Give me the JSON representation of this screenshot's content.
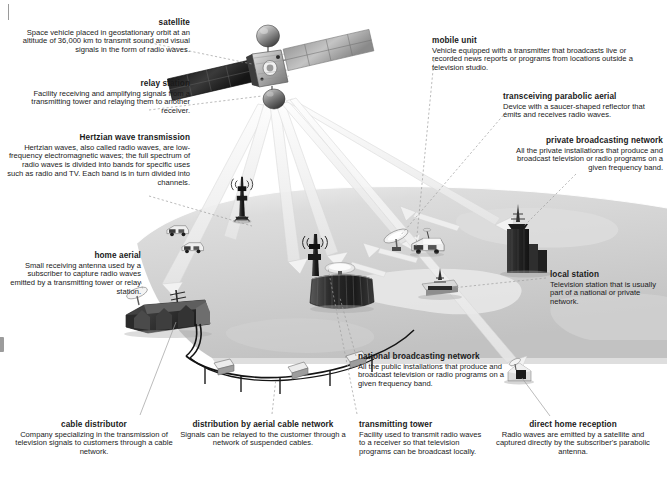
{
  "figure": {
    "background_color": "#ffffff",
    "text_color": "#1a1a1a",
    "leader_line_color": "#9a9a9a",
    "ground_color": "#c9c9c9",
    "ground_light_color": "#e2e2e2",
    "beam_color": "#efefef"
  },
  "callouts": [
    {
      "id": "satellite",
      "title": "satellite",
      "body": "Space vehicle placed in geostationary orbit at an altitude of 36,000 km to transmit sound and visual signals in the form of radio waves.",
      "align": "right"
    },
    {
      "id": "relay-station",
      "title": "relay station",
      "body": "Facility receiving and amplifying signals from a transmitting tower and relaying them to another receiver.",
      "align": "right"
    },
    {
      "id": "hertzian-wave-transmission",
      "title": "Hertzian wave transmission",
      "body": "Hertzian waves, also called radio waves, are low-frequency electromagnetic waves; the full spectrum of radio waves is divided into bands for specific uses such as radio and TV. Each band is in turn divided into channels.",
      "align": "right"
    },
    {
      "id": "home-aerial",
      "title": "home aerial",
      "body": "Small receiving antenna used by a subscriber to capture radio waves emitted by a transmitting tower or relay station.",
      "align": "right"
    },
    {
      "id": "cable-distributor",
      "title": "cable distributor",
      "body": "Company specializing in the transmission of television signals to customers through a cable network.",
      "align": "center"
    },
    {
      "id": "distribution-by-aerial-cable-network",
      "title": "distribution by aerial cable network",
      "body": "Signals can be relayed to the customer through a network of suspended cables.",
      "align": "center"
    },
    {
      "id": "transmitting-tower",
      "title": "transmitting tower",
      "body": "Facility used to transmit radio waves to a receiver so that television programs can be broadcast locally.",
      "align": "left"
    },
    {
      "id": "direct-home-reception",
      "title": "direct home reception",
      "body": "Radio waves are emitted by a satellite and captured directly by the subscriber's parabolic antenna.",
      "align": "center"
    },
    {
      "id": "national-broadcasting-network",
      "title": "national broadcasting network",
      "body": "All the public installations that produce and broadcast television or radio programs on a given frequency band.",
      "align": "left"
    },
    {
      "id": "local-station",
      "title": "local station",
      "body": "Television station that is usually part of a national or private network.",
      "align": "left"
    },
    {
      "id": "mobile-unit",
      "title": "mobile unit",
      "body": "Vehicle equipped with a transmitter that broadcasts live or recorded news reports or programs from locations outside a television studio.",
      "align": "left"
    },
    {
      "id": "transceiving-parabolic-aerial",
      "title": "transceiving parabolic aerial",
      "body": "Device with a saucer-shaped reflector that emits and receives radio waves.",
      "align": "left"
    },
    {
      "id": "private-broadcasting-network",
      "title": "private broadcasting network",
      "body": "All the private installations that produce and broadcast television or radio programs on a given frequency band.",
      "align": "right"
    }
  ]
}
